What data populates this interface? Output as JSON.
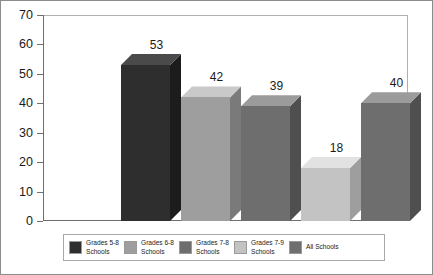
{
  "chart_data": {
    "type": "bar",
    "title": "",
    "subtitle": "",
    "xlabel": "",
    "ylabel": "",
    "ylim": [
      0,
      70
    ],
    "ytick_interval": 10,
    "ytick_labels": [
      "0",
      "10",
      "20",
      "30",
      "40",
      "50",
      "60",
      "70"
    ],
    "grid": false,
    "legend_position": "bottom",
    "style": "3d-bar",
    "categories": [
      "Grades 5-8 Schools",
      "Grades 6-8 Schools",
      "Grades 7-8 Schools",
      "Grades 7-9 Schools",
      "All Schools"
    ],
    "values": [
      53,
      42,
      39,
      18,
      40
    ],
    "value_labels": [
      "53",
      "42",
      "39",
      "18",
      "40"
    ],
    "colors": [
      "#2e2e2e",
      "#9e9e9e",
      "#6e6e6e",
      "#c3c3c3",
      "#6e6e6e"
    ],
    "top_face_colors": [
      "#4a4a4a",
      "#c9c9c9",
      "#9b9b9b",
      "#e2e2e2",
      "#9b9b9b"
    ],
    "side_face_colors": [
      "#1c1c1c",
      "#7a7a7a",
      "#4f4f4f",
      "#9e9e9e",
      "#4f4f4f"
    ]
  },
  "legend": {
    "items": [
      {
        "label": "Grades 5-8\nSchools",
        "color": "#2e2e2e"
      },
      {
        "label": "Grades 6-8\nSchools",
        "color": "#9e9e9e"
      },
      {
        "label": "Grades 7-8\nSchools",
        "color": "#6e6e6e"
      },
      {
        "label": "Grades 7-9\nSchools",
        "color": "#c3c3c3"
      },
      {
        "label": "All Schools",
        "color": "#6e6e6e"
      }
    ]
  },
  "axis": {
    "y_ticks": [
      "70",
      "60",
      "50",
      "40",
      "30",
      "20",
      "10",
      "0"
    ]
  }
}
